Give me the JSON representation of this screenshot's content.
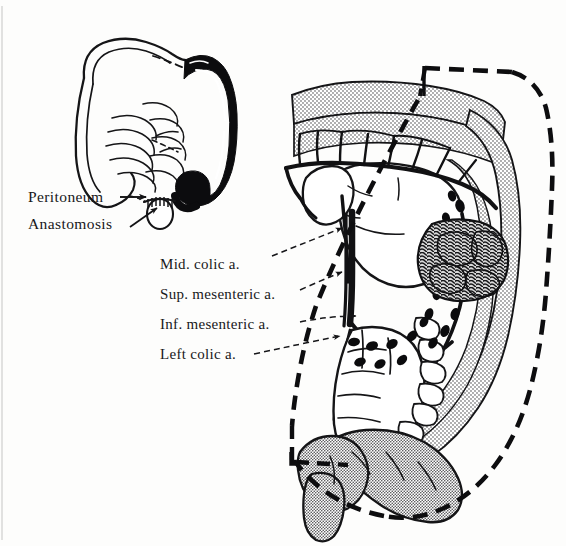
{
  "figure": {
    "background_color": "#fdfdfc",
    "ink_color": "#101012",
    "stipple_color": "#3a3a3c",
    "width": 566,
    "height": 546
  },
  "inset": {
    "name": "colon-orientation-inset",
    "description": "Small colon diagram with resected left colon shaded solid black",
    "resected_segment_color": "#0b0b0d",
    "retained_segment_color": "#ffffff"
  },
  "labels": {
    "peritoneum": {
      "text": "Peritoneum",
      "arrow": "straight-arrow-right",
      "x": 28,
      "y": 202
    },
    "anastomosis": {
      "text": "Anastomosis",
      "arrow": "diagonal-arrow-up-right",
      "x": 28,
      "y": 229
    },
    "mid_colic": {
      "text": "Mid. colic a.",
      "arrow": "dashed-leader",
      "x": 160,
      "y": 269
    },
    "sup_mesenteric": {
      "text": "Sup. mesenteric a.",
      "arrow": "dashed-leader",
      "x": 160,
      "y": 299
    },
    "inf_mesenteric": {
      "text": "Inf. mesenteric a.",
      "arrow": "dashed-leader",
      "x": 160,
      "y": 329
    },
    "left_colic": {
      "text": "Left colic a.",
      "arrow": "dashed-leader",
      "x": 160,
      "y": 359
    }
  },
  "main_illustration": {
    "name": "left-hemicolectomy-resection-field",
    "features": {
      "mesentery": "stippled",
      "resection_line": "heavy-dashed",
      "lymph_nodes": "solid-black-ovals",
      "tumor_mass": "dark-scribbled-mass",
      "arteries": "bold-black-lines",
      "haustra": "outlined-segments"
    },
    "lymph_node_count": 22
  }
}
